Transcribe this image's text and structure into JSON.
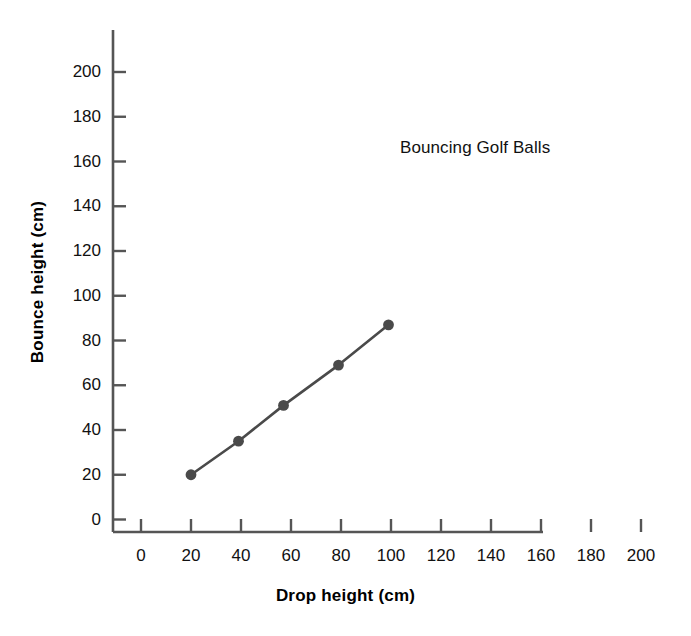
{
  "chart_data": {
    "type": "line",
    "title": "Bouncing Golf Balls",
    "xlabel": "Drop height (cm)",
    "ylabel": "Bounce height (cm)",
    "xlim": [
      0,
      200
    ],
    "ylim": [
      0,
      210
    ],
    "xticks": [
      0,
      20,
      40,
      60,
      80,
      100,
      120,
      140,
      160,
      180,
      200
    ],
    "yticks": [
      0,
      20,
      40,
      60,
      80,
      100,
      120,
      140,
      160,
      180,
      200
    ],
    "xtick_labels": [
      "0",
      "20",
      "40",
      "60",
      "80",
      "100",
      "120",
      "140",
      "160",
      "180",
      "200"
    ],
    "ytick_labels": [
      "0",
      "20",
      "40",
      "60",
      "80",
      "100",
      "120",
      "140",
      "160",
      "180",
      "200"
    ],
    "grid": false,
    "legend": "none",
    "series": [
      {
        "name": "Bouncing Golf Balls",
        "color": "#4a4a4a",
        "marker": "circle",
        "x": [
          20,
          39,
          57,
          79,
          99
        ],
        "y": [
          20,
          35,
          51,
          69,
          87
        ]
      }
    ]
  },
  "style": {
    "axis_color": "#555555",
    "text_color": "#111111",
    "background": "#ffffff",
    "line_color": "#4a4a4a",
    "marker_color": "#4a4a4a"
  }
}
